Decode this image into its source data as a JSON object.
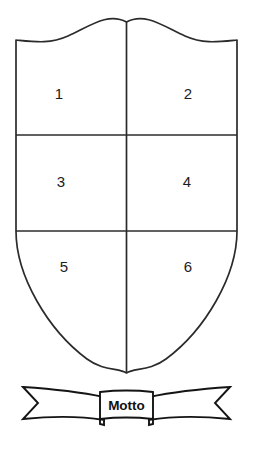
{
  "figure": {
    "background_color": "#ffffff",
    "line_color": "#2b2b2b",
    "fill_color": "#ffffff"
  },
  "shield": {
    "name": "shield",
    "quarter_count": 6,
    "quarters": [
      {
        "id": "quarter-1",
        "label": "1",
        "row": 1,
        "column": 1,
        "cx": 59,
        "cy": 95
      },
      {
        "id": "quarter-2",
        "label": "2",
        "row": 1,
        "column": 2,
        "cx": 188,
        "cy": 95
      },
      {
        "id": "quarter-3",
        "label": "3",
        "row": 2,
        "column": 1,
        "cx": 61,
        "cy": 183
      },
      {
        "id": "quarter-4",
        "label": "4",
        "row": 2,
        "column": 2,
        "cx": 187,
        "cy": 183
      },
      {
        "id": "quarter-5",
        "label": "5",
        "row": 3,
        "column": 1,
        "cx": 64,
        "cy": 268
      },
      {
        "id": "quarter-6",
        "label": "6",
        "row": 3,
        "column": 2,
        "cx": 188,
        "cy": 268
      }
    ],
    "dividers": {
      "vertical_label": "pale divider",
      "horizontal_labels": [
        "upper fess divider",
        "lower fess divider"
      ]
    }
  },
  "banner": {
    "name": "motto-banner",
    "motto_text": "Motto",
    "text_color": "#111111",
    "outline_color": "#141414"
  }
}
